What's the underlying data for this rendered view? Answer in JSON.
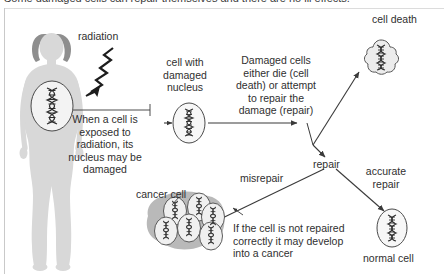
{
  "page": {
    "clipped_heading": "Some damaged cells can repair themselves and there are no ill effects.",
    "background_color": "#ffffff",
    "line_color": "#3a3a3a",
    "body_fill": "#d8d8d8",
    "hair_fill": "#8e8e8e",
    "cell_fill": "#f3f3f3",
    "tumour_fill": "#b9b9b9"
  },
  "diagram": {
    "labels": {
      "radiation": "radiation",
      "cell_with_damaged_nucleus": "cell with\ndamaged\nnucleus",
      "cell_death": "cell death",
      "repair": "repair",
      "misrepair": "misrepair",
      "accurate_repair": "accurate\nrepair",
      "cancer_cell": "cancer cell",
      "normal_cell": "normal cell"
    },
    "label_lines": {
      "cell_with_damaged_nucleus": [
        "cell with",
        "damaged",
        "nucleus"
      ],
      "accurate_repair": [
        "accurate",
        "repair"
      ]
    },
    "text_blocks": {
      "exposure": {
        "lines": [
          "When a cell is",
          "exposed to",
          "radiation, its",
          "nucleus may be",
          "damaged"
        ],
        "align": "center"
      },
      "outcomes": {
        "lines": [
          "Damaged cells",
          "either die (cell",
          "death) or attempt",
          "to repair the",
          "damage (repair)"
        ],
        "align": "center"
      },
      "cancer": {
        "lines": [
          "If the cell is not repaired",
          "correctly it may develop",
          "into a cancer"
        ],
        "align": "left"
      }
    },
    "icons": {
      "human_figure": "female-body-silhouette-icon",
      "radiation_arrow": "zigzag-radiation-arrow-icon",
      "irradiated_cell": "cell-with-dna-icon",
      "damaged_nucleus_cell": "cell-with-damaged-dna-icon",
      "dead_cell": "dying-cell-blob-icon",
      "cancer_cluster": "cancer-cell-cluster-icon",
      "normal_cell": "normal-cell-with-dna-icon"
    },
    "flow": [
      {
        "from": "irradiated-cell",
        "to": "damaged-nucleus-cell",
        "label": ""
      },
      {
        "from": "damaged-nucleus-cell",
        "to": "branch-point",
        "label": ""
      },
      {
        "from": "branch-point",
        "to": "cell-death",
        "label": "cell death"
      },
      {
        "from": "branch-point",
        "to": "repair",
        "label": "repair"
      },
      {
        "from": "repair",
        "to": "cancer-cluster",
        "label": "misrepair"
      },
      {
        "from": "repair",
        "to": "normal-cell",
        "label": "accurate repair"
      }
    ]
  }
}
